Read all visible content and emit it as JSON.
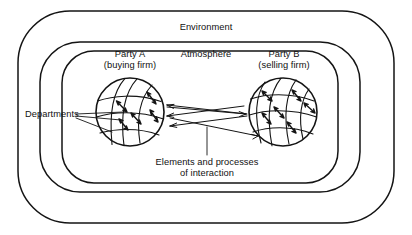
{
  "diagram": {
    "title_visible": false,
    "labels": {
      "environment": "Environment",
      "atmosphere": "Atmosphere",
      "party_a_line1": "Party A",
      "party_a_line2": "(buying firm)",
      "party_b_line1": "Party B",
      "party_b_line2": "(selling firm)",
      "departments": "Departments",
      "interaction_line1": "Elements and processes",
      "interaction_line2": "of interaction"
    },
    "colors": {
      "stroke": "#141414",
      "text": "#111111",
      "background": "#ffffff"
    },
    "rings": [
      {
        "name": "environment-boundary",
        "x": 18,
        "y": 11,
        "w": 376,
        "h": 212,
        "r": 52
      },
      {
        "name": "atmosphere-boundary",
        "x": 40,
        "y": 42,
        "w": 320,
        "h": 150,
        "r": 38
      },
      {
        "name": "inner-boundary",
        "x": 62,
        "y": 51,
        "w": 276,
        "h": 132,
        "r": 30
      }
    ],
    "spheres": [
      {
        "name": "party-a-sphere",
        "cx": 130,
        "cy": 112,
        "r": 34
      },
      {
        "name": "party-b-sphere",
        "cx": 283,
        "cy": 112,
        "r": 34
      }
    ]
  }
}
